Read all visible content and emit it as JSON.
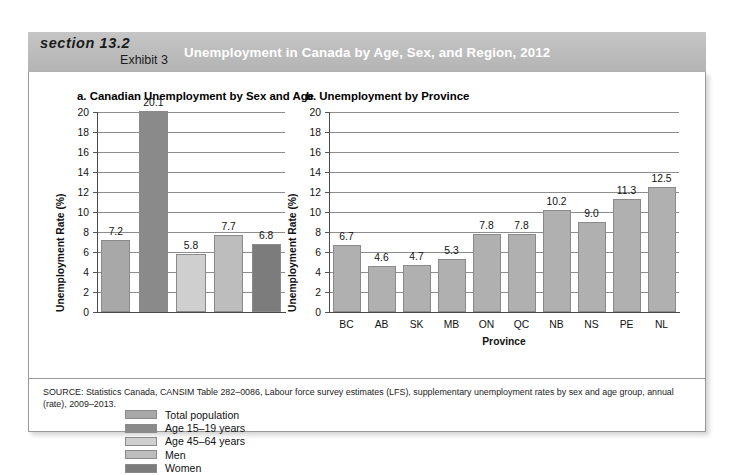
{
  "header": {
    "section_label": "section 13.2",
    "exhibit_label": "Exhibit 3",
    "title": "Unemployment in Canada by Age, Sex, and Region, 2012",
    "band_color": "#bdbdbd",
    "title_color": "#ffffff"
  },
  "source": {
    "text": "SOURCE: Statistics Canada, CANSIM Table 282–0086, Labour force survey estimates (LFS), supplementary unemployment rates by sex and age group, annual (rate), 2009–2013."
  },
  "legend": {
    "items": [
      {
        "label": "Total population",
        "color": "#a8a8a8"
      },
      {
        "label": "Age 15–19 years",
        "color": "#8a8a8a"
      },
      {
        "label": "Age 45–64 years",
        "color": "#cfcfcf"
      },
      {
        "label": "Men",
        "color": "#bdbdbd"
      },
      {
        "label": "Women",
        "color": "#7c7c7c"
      }
    ]
  },
  "chart_data": [
    {
      "type": "bar",
      "panel_id": "a",
      "title": "a. Canadian Unemployment by Sex and Age",
      "categories": [
        "Total population",
        "Age 15–19 years",
        "Age 45–64 years",
        "Men",
        "Women"
      ],
      "values": [
        7.2,
        20.1,
        5.8,
        7.7,
        6.8
      ],
      "colors": [
        "#a8a8a8",
        "#8a8a8a",
        "#cfcfcf",
        "#bdbdbd",
        "#7c7c7c"
      ],
      "xlabel": "",
      "ylabel": "Unemployment Rate (%)",
      "ylim": [
        0,
        20
      ],
      "yticks": [
        0,
        2,
        4,
        6,
        8,
        10,
        12,
        14,
        16,
        18,
        20
      ],
      "grid": true,
      "xtick_labels": [],
      "legend_position": "below"
    },
    {
      "type": "bar",
      "panel_id": "b",
      "title": "b. Unemployment by Province",
      "categories": [
        "BC",
        "AB",
        "SK",
        "MB",
        "ON",
        "QC",
        "NB",
        "NS",
        "PE",
        "NL"
      ],
      "values": [
        6.7,
        4.6,
        4.7,
        5.3,
        7.8,
        7.8,
        10.2,
        9.0,
        11.3,
        12.5
      ],
      "bar_color": "#b0b0b0",
      "xlabel": "Province",
      "ylabel": "Unemployment Rate (%)",
      "ylim": [
        0,
        20
      ],
      "yticks": [
        0,
        2,
        4,
        6,
        8,
        10,
        12,
        14,
        16,
        18,
        20
      ],
      "grid": true,
      "legend_position": "none"
    }
  ]
}
